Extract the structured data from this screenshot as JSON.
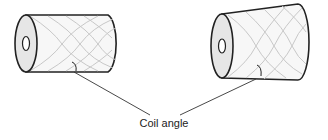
{
  "diagram": {
    "title": "Coil angle",
    "label": "Coil angle",
    "shapes": [
      {
        "name": "cylindrical-package",
        "type": "cylinder"
      },
      {
        "name": "conical-package",
        "type": "cone"
      }
    ],
    "colors": {
      "outline": "#222222",
      "end_face": "#e6e6e6",
      "body": "#f7f7f7",
      "winding": "#c8c8c8"
    }
  }
}
